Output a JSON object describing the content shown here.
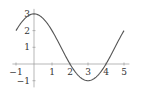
{
  "chart_data": {
    "type": "line",
    "title": "",
    "xlabel": "",
    "ylabel": "",
    "xlim": [
      -1.2,
      5.3
    ],
    "ylim": [
      -1.4,
      3.3
    ],
    "grid": false,
    "legend": null,
    "x_ticks": [
      -1,
      1,
      2,
      3,
      4,
      5
    ],
    "x_tick_labels": [
      "−1",
      "1",
      "2",
      "3",
      "4",
      "5"
    ],
    "y_ticks": [
      -1,
      1,
      2,
      3
    ],
    "y_tick_labels": [
      "−1",
      "1",
      "2",
      "3"
    ],
    "series": [
      {
        "name": "y = 1 + 2cos(πx/3)",
        "x": [
          -1,
          -0.5,
          0,
          0.5,
          1,
          1.5,
          2,
          2.5,
          3,
          3.5,
          4,
          4.5,
          5
        ],
        "values": [
          2,
          2.73,
          3,
          2.73,
          2,
          1,
          0,
          -0.73,
          -1,
          -0.73,
          0,
          1,
          2
        ]
      }
    ],
    "colors": {
      "curve": "#555555",
      "axis": "#999999"
    }
  }
}
